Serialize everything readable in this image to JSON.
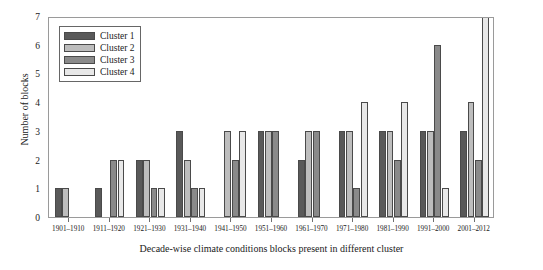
{
  "chart_data": {
    "type": "bar",
    "title": "",
    "xlabel": "Decade-wise climate conditions blocks present in different cluster",
    "ylabel": "Number of blocks",
    "ylim": [
      0,
      7
    ],
    "yticks": [
      0,
      1,
      2,
      3,
      4,
      5,
      6,
      7
    ],
    "grid": false,
    "legend_position": "upper left",
    "categories": [
      "1901–1910",
      "1911–1920",
      "1921–1930",
      "1931–1940",
      "1941–1950",
      "1951–1960",
      "1961–1970",
      "1971–1980",
      "1981–1990",
      "1991–2000",
      "2001–2012"
    ],
    "series": [
      {
        "name": "Cluster 1",
        "color": "#595959",
        "values": [
          1,
          1,
          2,
          3,
          0,
          3,
          2,
          3,
          3,
          3,
          3
        ]
      },
      {
        "name": "Cluster 2",
        "color": "#bdbdbd",
        "values": [
          1,
          0,
          2,
          2,
          3,
          3,
          3,
          3,
          3,
          3,
          4
        ]
      },
      {
        "name": "Cluster 3",
        "color": "#8a8a8a",
        "values": [
          0,
          2,
          1,
          1,
          2,
          3,
          3,
          1,
          2,
          6,
          2
        ]
      },
      {
        "name": "Cluster 4",
        "color": "#e8e8e8",
        "values": [
          0,
          2,
          1,
          1,
          3,
          0,
          0,
          4,
          4,
          1,
          7
        ]
      }
    ]
  },
  "legend": {
    "items": [
      {
        "label": "Cluster 1"
      },
      {
        "label": "Cluster 2"
      },
      {
        "label": "Cluster 3"
      },
      {
        "label": "Cluster 4"
      }
    ]
  }
}
